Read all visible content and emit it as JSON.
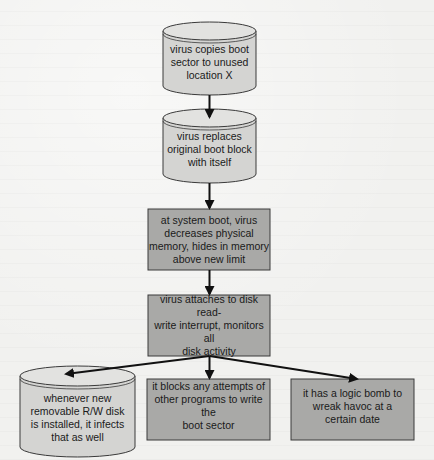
{
  "diagram": {
    "type": "flowchart",
    "colors": {
      "background": "#f1f1ef",
      "cylinder_fill": "#d4d4d2",
      "cylinder_top": "#e2e2e0",
      "box_fill": "#a9a9a7",
      "stroke": "#3a3a3a",
      "arrow": "#111111",
      "text": "#1a1a1a"
    },
    "nodes": [
      {
        "id": "n1",
        "shape": "cylinder",
        "text": "virus copies boot\nsector to unused\nlocation X"
      },
      {
        "id": "n2",
        "shape": "cylinder",
        "text": "virus replaces\noriginal boot block\nwith itself"
      },
      {
        "id": "n3",
        "shape": "rectangle",
        "text": "at system boot, virus\ndecreases physical\nmemory, hides in memory\nabove new limit"
      },
      {
        "id": "n4",
        "shape": "rectangle",
        "text": "virus attaches to disk read-\nwrite interrupt, monitors all\ndisk activity"
      },
      {
        "id": "n5",
        "shape": "cylinder",
        "text": "whenever new\nremovable R/W disk\nis installed, it infects\nthat as well"
      },
      {
        "id": "n6",
        "shape": "rectangle",
        "text": "it blocks any attempts of\nother programs to write the\nboot sector"
      },
      {
        "id": "n7",
        "shape": "rectangle",
        "text": "it has a logic bomb to\nwreak havoc at a\ncertain date"
      }
    ],
    "edges": [
      {
        "from": "n1",
        "to": "n2"
      },
      {
        "from": "n2",
        "to": "n3"
      },
      {
        "from": "n3",
        "to": "n4"
      },
      {
        "from": "n4",
        "to": "n5"
      },
      {
        "from": "n4",
        "to": "n6"
      },
      {
        "from": "n4",
        "to": "n7"
      }
    ]
  }
}
